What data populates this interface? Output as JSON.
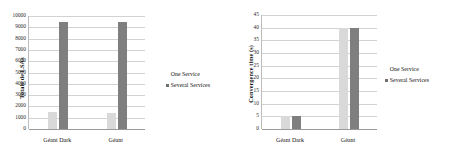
{
  "figure": {
    "background": "#ffffff",
    "colors": {
      "one_service": "#d9d9d9",
      "several_services": "#7f7f7f",
      "gridline": "#d2d2d2",
      "axis": "#9a9a9a"
    }
  },
  "legend": {
    "one_service": "One Service",
    "several_services": "Several Services"
  },
  "chart_data": [
    {
      "type": "bar",
      "title": "",
      "xlabel": "",
      "ylabel": "Totale de LSAs",
      "categories": [
        "Géant Dark",
        "Géant"
      ],
      "series": [
        {
          "name": "One Service",
          "values": [
            1500,
            1450
          ]
        },
        {
          "name": "Several Services",
          "values": [
            9500,
            9450
          ]
        }
      ],
      "ylim": [
        0,
        10000
      ],
      "yticks": [
        0,
        1000,
        2000,
        3000,
        4000,
        5000,
        6000,
        7000,
        8000,
        9000,
        10000
      ],
      "ytick_labels": [
        "0",
        "1000",
        "2000",
        "3000",
        "4000",
        "5000",
        "6000",
        "7000",
        "8000",
        "9000",
        "10000"
      ],
      "grid": true,
      "legend_position": "right"
    },
    {
      "type": "bar",
      "title": "",
      "xlabel": "",
      "ylabel": "Convergence time (s)",
      "categories": [
        "Géant Dark",
        "Géant"
      ],
      "series": [
        {
          "name": "One Service",
          "values": [
            5,
            40
          ]
        },
        {
          "name": "Several Services",
          "values": [
            5,
            40
          ]
        }
      ],
      "ylim": [
        0,
        45
      ],
      "yticks": [
        0,
        5,
        10,
        15,
        20,
        25,
        30,
        35,
        40,
        45
      ],
      "ytick_labels": [
        "0",
        "5",
        "10",
        "15",
        "20",
        "25",
        "30",
        "35",
        "40",
        "45"
      ],
      "grid": true,
      "legend_position": "right"
    }
  ]
}
